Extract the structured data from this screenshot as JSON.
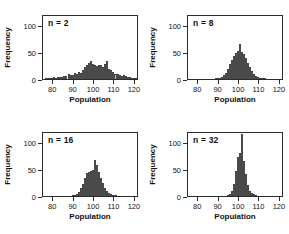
{
  "figure": {
    "axis_title_x": "Population",
    "axis_title_y": "Frequency"
  },
  "chart_data": [
    {
      "type": "bar",
      "title": "n = 2",
      "xlabel": "Population",
      "ylabel": "Frequency",
      "xlim": [
        75,
        122
      ],
      "ylim": [
        0,
        120
      ],
      "xticks": [
        80,
        90,
        100,
        110,
        120
      ],
      "yticks": [
        0,
        50,
        100
      ],
      "grid": false,
      "bin_width": 1,
      "bin_starts": [
        76,
        77,
        78,
        79,
        80,
        81,
        82,
        83,
        84,
        85,
        86,
        87,
        88,
        89,
        90,
        91,
        92,
        93,
        94,
        95,
        96,
        97,
        98,
        99,
        100,
        101,
        102,
        103,
        104,
        105,
        106,
        107,
        108,
        109,
        110,
        111,
        112,
        113,
        114,
        115,
        116,
        117,
        118,
        119,
        120,
        121
      ],
      "values": [
        1,
        1,
        2,
        2,
        3,
        2,
        3,
        4,
        3,
        6,
        5,
        9,
        8,
        7,
        11,
        10,
        13,
        11,
        16,
        22,
        26,
        29,
        33,
        27,
        26,
        24,
        26,
        25,
        22,
        28,
        34,
        18,
        16,
        13,
        10,
        9,
        7,
        6,
        8,
        5,
        4,
        3,
        2,
        2,
        1,
        1
      ]
    },
    {
      "type": "bar",
      "title": "n = 8",
      "xlabel": "Population",
      "ylabel": "Frequency",
      "xlim": [
        75,
        122
      ],
      "ylim": [
        0,
        120
      ],
      "xticks": [
        80,
        90,
        100,
        110,
        120
      ],
      "yticks": [
        0,
        50,
        100
      ],
      "grid": false,
      "bin_width": 1,
      "bin_starts": [
        76,
        77,
        78,
        79,
        80,
        81,
        82,
        83,
        84,
        85,
        86,
        87,
        88,
        89,
        90,
        91,
        92,
        93,
        94,
        95,
        96,
        97,
        98,
        99,
        100,
        101,
        102,
        103,
        104,
        105,
        106,
        107,
        108,
        109,
        110,
        111,
        112,
        113,
        114,
        115,
        116,
        117,
        118,
        119,
        120,
        121
      ],
      "values": [
        0,
        0,
        0,
        0,
        0,
        0,
        0,
        0,
        0,
        0,
        0,
        0,
        1,
        1,
        2,
        4,
        7,
        12,
        18,
        27,
        36,
        42,
        48,
        52,
        64,
        50,
        46,
        38,
        30,
        22,
        14,
        9,
        5,
        3,
        2,
        1,
        1,
        0,
        0,
        0,
        0,
        0,
        0,
        0,
        0,
        0
      ]
    },
    {
      "type": "bar",
      "title": "n = 16",
      "xlabel": "Population",
      "ylabel": "Frequency",
      "xlim": [
        75,
        122
      ],
      "ylim": [
        0,
        120
      ],
      "xticks": [
        80,
        90,
        100,
        110,
        120
      ],
      "yticks": [
        0,
        50,
        100
      ],
      "grid": false,
      "bin_width": 1,
      "bin_starts": [
        76,
        77,
        78,
        79,
        80,
        81,
        82,
        83,
        84,
        85,
        86,
        87,
        88,
        89,
        90,
        91,
        92,
        93,
        94,
        95,
        96,
        97,
        98,
        99,
        100,
        101,
        102,
        103,
        104,
        105,
        106,
        107,
        108,
        109,
        110,
        111,
        112,
        113,
        114,
        115,
        116,
        117,
        118,
        119,
        120,
        121
      ],
      "values": [
        0,
        0,
        0,
        0,
        0,
        0,
        0,
        0,
        0,
        0,
        0,
        0,
        0,
        1,
        2,
        4,
        8,
        14,
        22,
        33,
        42,
        45,
        46,
        48,
        67,
        58,
        44,
        33,
        24,
        15,
        9,
        5,
        3,
        1,
        1,
        0,
        0,
        0,
        0,
        0,
        0,
        0,
        0,
        0,
        0,
        0
      ]
    },
    {
      "type": "bar",
      "title": "n = 32",
      "xlabel": "Population",
      "ylabel": "Frequency",
      "xlim": [
        75,
        122
      ],
      "ylim": [
        0,
        120
      ],
      "xticks": [
        80,
        90,
        100,
        110,
        120
      ],
      "yticks": [
        0,
        50,
        100
      ],
      "grid": false,
      "bin_width": 1,
      "bin_starts": [
        76,
        77,
        78,
        79,
        80,
        81,
        82,
        83,
        84,
        85,
        86,
        87,
        88,
        89,
        90,
        91,
        92,
        93,
        94,
        95,
        96,
        97,
        98,
        99,
        100,
        101,
        102,
        103,
        104,
        105,
        106,
        107,
        108,
        109,
        110,
        111,
        112,
        113,
        114,
        115,
        116,
        117,
        118,
        119,
        120,
        121
      ],
      "values": [
        0,
        0,
        0,
        0,
        0,
        0,
        0,
        0,
        0,
        0,
        0,
        0,
        0,
        0,
        0,
        0,
        0,
        0,
        2,
        4,
        10,
        22,
        46,
        72,
        80,
        115,
        64,
        40,
        20,
        10,
        6,
        3,
        1,
        0,
        0,
        0,
        0,
        0,
        0,
        0,
        0,
        0,
        0,
        0,
        0,
        0
      ]
    }
  ]
}
